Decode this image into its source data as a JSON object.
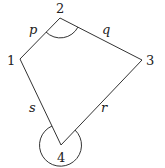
{
  "diagram": {
    "type": "quadrilateral",
    "vertices": [
      {
        "id": "1",
        "label": "1",
        "x": 20,
        "y": 59
      },
      {
        "id": "2",
        "label": "2",
        "x": 60,
        "y": 18
      },
      {
        "id": "3",
        "label": "3",
        "x": 142,
        "y": 60
      },
      {
        "id": "4",
        "label": "4",
        "x": 61,
        "y": 145
      }
    ],
    "edges": [
      {
        "from": "1",
        "to": "2",
        "label": "p"
      },
      {
        "from": "2",
        "to": "3",
        "label": "q"
      },
      {
        "from": "3",
        "to": "4",
        "label": "r"
      },
      {
        "from": "4",
        "to": "1",
        "label": "s"
      }
    ],
    "angle_marks": [
      {
        "vertex": "2",
        "type": "interior-arc"
      },
      {
        "vertex": "4",
        "type": "reflex-circle"
      }
    ]
  }
}
